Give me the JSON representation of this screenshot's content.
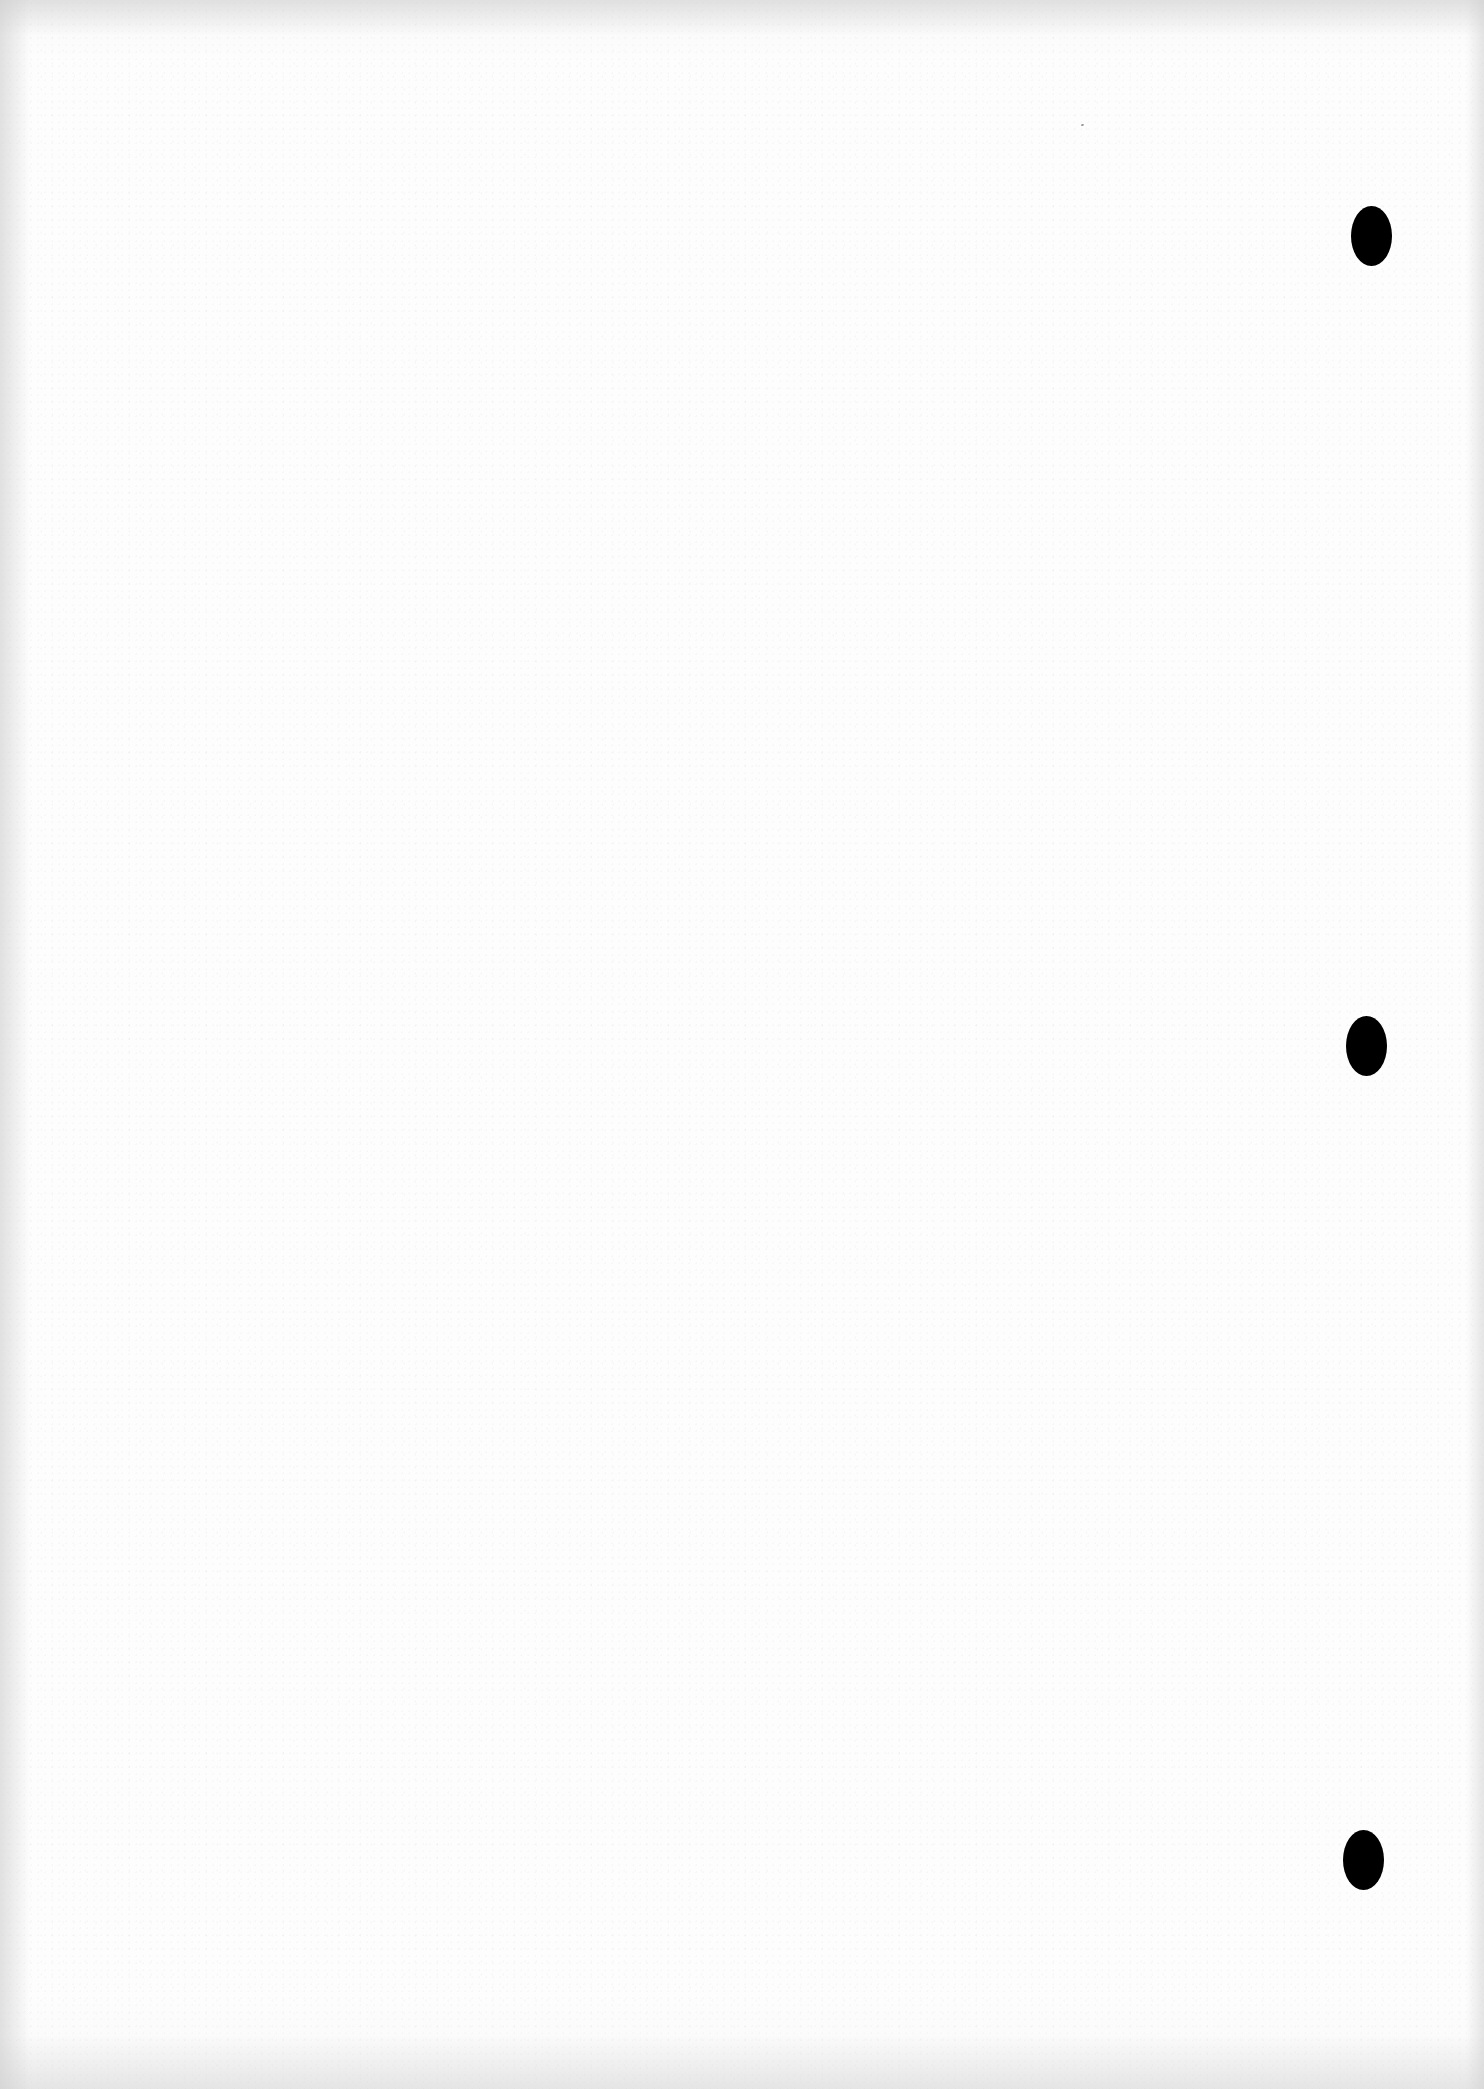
{
  "page": {
    "type": "blank scanned sheet",
    "background_color": "#fdfdfd",
    "text": ""
  },
  "punch_holes": [
    {
      "label": "top-punch-hole",
      "cx": 1372,
      "cy": 236,
      "color": "#000000"
    },
    {
      "label": "middle-punch-hole",
      "cx": 1367,
      "cy": 1046,
      "color": "#000000"
    },
    {
      "label": "bottom-punch-hole",
      "cx": 1364,
      "cy": 1860,
      "color": "#000000"
    }
  ]
}
